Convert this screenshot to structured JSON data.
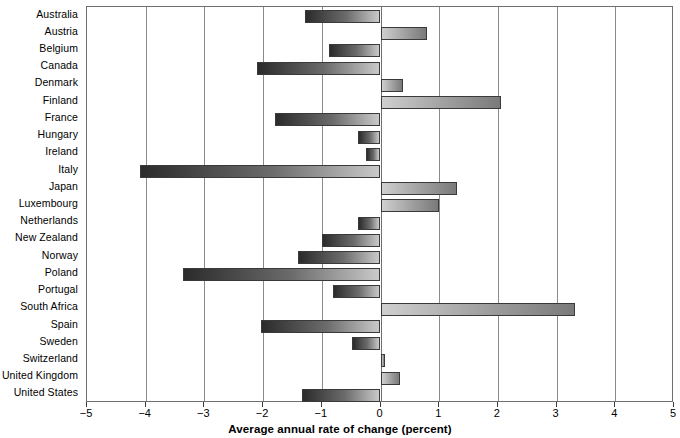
{
  "chart_data": {
    "type": "bar",
    "orientation": "horizontal",
    "title": "",
    "subtitle": "",
    "xlabel": "Average annual rate of change (percent)",
    "ylabel": "",
    "xlim": [
      -5,
      5
    ],
    "xticks": [
      -5,
      -4,
      -3,
      -2,
      -1,
      0,
      1,
      2,
      3,
      4,
      5
    ],
    "xtick_labels": [
      "−5",
      "−4",
      "−3",
      "−2",
      "−1",
      "0",
      "1",
      "2",
      "3",
      "4",
      "5"
    ],
    "grid": "vertical gridlines at every integer tick",
    "legend": "none",
    "categories": [
      "Australia",
      "Austria",
      "Belgium",
      "Canada",
      "Denmark",
      "Finland",
      "France",
      "Hungary",
      "Ireland",
      "Italy",
      "Japan",
      "Luxembourg",
      "Netherlands",
      "New Zealand",
      "Norway",
      "Poland",
      "Portugal",
      "South Africa",
      "Spain",
      "Sweden",
      "Switzerland",
      "United Kingdom",
      "United States"
    ],
    "values": [
      -1.28,
      0.79,
      -0.87,
      -2.1,
      0.39,
      2.06,
      -1.79,
      -0.38,
      -0.24,
      -4.09,
      1.31,
      0.99,
      -0.38,
      -1.0,
      -1.4,
      -3.36,
      -0.81,
      3.31,
      -2.03,
      -0.49,
      0.08,
      0.34,
      -1.33
    ]
  },
  "colors": {
    "negative_bar_dark": "#2b2b2b",
    "negative_bar_light": "#c9c9c9",
    "positive_bar_light": "#cfcfcf",
    "positive_bar_dark": "#7a7a7a",
    "axis": "#6e6e6e",
    "gridline": "#8a8a8a",
    "background": "#ffffff",
    "text": "#000000"
  }
}
